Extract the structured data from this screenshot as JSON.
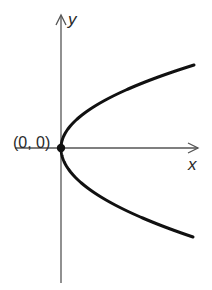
{
  "figure": {
    "type": "parabola_graph",
    "equation_form": "x = a*y^2 (parabola opening to the right, vertex at origin)",
    "axes": {
      "x_label": "x",
      "y_label": "y"
    },
    "vertex": {
      "label": "(0, 0)",
      "x": 0,
      "y": 0
    },
    "colors": {
      "curve": "#111111",
      "axes": "#555555",
      "text": "#2a2a2a",
      "background": "#ffffff"
    }
  }
}
